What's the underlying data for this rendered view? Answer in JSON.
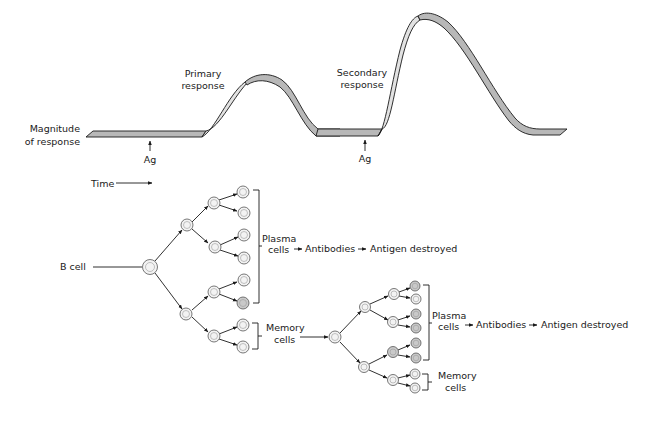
{
  "graph": {
    "y_label_line1": "Magnitude",
    "y_label_line2": "of response",
    "primary_label_line1": "Primary",
    "primary_label_line2": "response",
    "secondary_label_line1": "Secondary",
    "secondary_label_line2": "response",
    "antigen_marker_1": "Ag",
    "antigen_marker_2": "Ag",
    "time_label": "Time"
  },
  "primary_tree": {
    "origin_label": "B cell",
    "plasma_label_line1": "Plasma",
    "plasma_label_line2": "cells",
    "antibodies_label": "Antibodies",
    "outcome_label": "Antigen destroyed",
    "memory_label_line1": "Memory",
    "memory_label_line2": "cells"
  },
  "secondary_tree": {
    "plasma_label_line1": "Plasma",
    "plasma_label_line2": "cells",
    "antibodies_label": "Antibodies",
    "outcome_label": "Antigen destroyed",
    "memory_label_line1": "Memory",
    "memory_label_line2": "cells"
  },
  "colors": {
    "ribbon_dark": "#b8b8b8",
    "ribbon_light": "#e2e2e2",
    "line": "#1a1a1a"
  }
}
